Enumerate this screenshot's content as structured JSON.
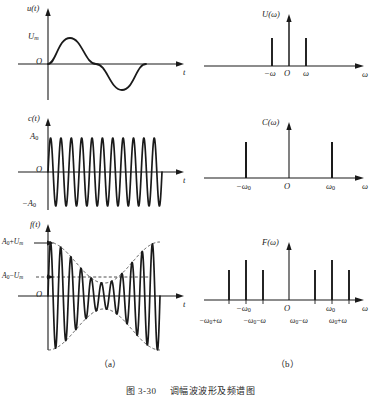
{
  "figure": {
    "caption_number": "图 3-30",
    "caption_text": "调幅波波形及频谱图",
    "sub_label_a": "（a）",
    "sub_label_b": "（b）",
    "ink_color": "#1a1a1a",
    "dash_color": "#3a3a3a"
  },
  "panels": {
    "u_t": {
      "y_axis_label": "u(t)",
      "x_axis_label": "t",
      "origin_label": "O",
      "amplitude_label": "U",
      "amplitude_sub": "m",
      "note": "one cycle of a low-frequency sine, positive half then negative half"
    },
    "U_w": {
      "y_axis_label": "U(ω)",
      "x_axis_label": "ω",
      "origin_label": "O",
      "ticks": [
        "−ω",
        "O",
        "ω"
      ]
    },
    "c_t": {
      "y_axis_label": "c(t)",
      "x_axis_label": "t",
      "origin_label": "O",
      "amplitude_pos": "A",
      "amplitude_pos_sub": "0",
      "amplitude_neg": "−A",
      "amplitude_neg_sub": "0",
      "note": "high frequency carrier, constant amplitude"
    },
    "C_w": {
      "y_axis_label": "C(ω)",
      "x_axis_label": "ω",
      "origin_label": "O",
      "tick_left": "−ω",
      "tick_left_sub": "0",
      "tick_right": "ω",
      "tick_right_sub": "0"
    },
    "f_t": {
      "y_axis_label": "f(t)",
      "x_axis_label": "t",
      "origin_label": "O",
      "upper_label_a": "A",
      "upper_label_a_sub": "0",
      "upper_label_op": "+",
      "upper_label_u": "U",
      "upper_label_u_sub": "m",
      "lower_label_a": "A",
      "lower_label_a_sub": "0",
      "lower_label_op": "−",
      "lower_label_u": "U",
      "lower_label_u_sub": "m",
      "note": "amplitude modulated carrier with dashed envelope"
    },
    "F_w": {
      "y_axis_label": "F(ω)",
      "x_axis_label": "ω",
      "origin_label": "O",
      "axis_tick_left": "−ω",
      "axis_tick_left_sub": "0",
      "axis_tick_right": "ω",
      "axis_tick_right_sub": "0",
      "lower_labels": [
        {
          "main": "−ω",
          "sub": "0",
          "op": "+",
          "tail": "ω"
        },
        {
          "main": "−ω",
          "sub": "0",
          "op": "−",
          "tail": "ω"
        },
        {
          "main": "ω",
          "sub": "0",
          "op": "−",
          "tail": "ω"
        },
        {
          "main": "ω",
          "sub": "0",
          "op": "+",
          "tail": "ω"
        }
      ]
    }
  },
  "chart_data": [
    {
      "type": "line",
      "id": "u_t",
      "title": "u(t)",
      "xlabel": "t",
      "ylabel": "u(t)",
      "x": [
        0,
        0.0625,
        0.125,
        0.1875,
        0.25,
        0.3125,
        0.375,
        0.4375,
        0.5,
        0.5625,
        0.625,
        0.6875,
        0.75,
        0.8125,
        0.875,
        0.9375,
        1.0
      ],
      "values": [
        0,
        0.383,
        0.707,
        0.924,
        1.0,
        0.924,
        0.707,
        0.383,
        0,
        -0.383,
        -0.707,
        -0.924,
        -1.0,
        -0.924,
        -0.707,
        -0.383,
        0
      ],
      "ytick_labels": [
        "U_m",
        "O"
      ],
      "ylim": [
        -1.2,
        1.3
      ],
      "grid": false
    },
    {
      "type": "bar",
      "id": "U_w",
      "title": "U(ω)",
      "xlabel": "ω",
      "ylabel": "U(ω)",
      "categories": [
        "-ω",
        "0",
        "ω"
      ],
      "values": [
        0.62,
        1.0,
        0.62
      ],
      "note": "impulse spectrum, centre impulse is the axis arrow height",
      "grid": false
    },
    {
      "type": "line",
      "id": "c_t",
      "title": "c(t)",
      "xlabel": "t",
      "ylabel": "c(t)",
      "carrier_cycles": 11,
      "amplitude": 1.0,
      "ytick_labels": [
        "A_0",
        "O",
        "-A_0"
      ],
      "ylim": [
        -1.25,
        1.25
      ],
      "grid": false
    },
    {
      "type": "bar",
      "id": "C_w",
      "title": "C(ω)",
      "xlabel": "ω",
      "ylabel": "C(ω)",
      "categories": [
        "-ω₀",
        "ω₀"
      ],
      "values": [
        0.72,
        0.72
      ],
      "grid": false
    },
    {
      "type": "line",
      "id": "f_t",
      "title": "f(t)",
      "xlabel": "t",
      "ylabel": "f(t)",
      "carrier_cycles": 11,
      "envelope_expression": "A_0 + U_m sin(ωt)",
      "A0": 0.62,
      "Um": 0.38,
      "ytick_labels": [
        "A_0+U_m",
        "A_0-U_m",
        "O"
      ],
      "ylim": [
        -1.05,
        1.05
      ],
      "grid": false
    },
    {
      "type": "bar",
      "id": "F_w",
      "title": "F(ω)",
      "xlabel": "ω",
      "ylabel": "F(ω)",
      "categories": [
        "-ω₀+ω",
        "-ω₀",
        "-ω₀-ω",
        "ω₀-ω",
        "ω₀",
        "ω₀+ω"
      ],
      "values": [
        0.46,
        0.72,
        0.46,
        0.46,
        0.72,
        0.46
      ],
      "grid": false
    }
  ]
}
